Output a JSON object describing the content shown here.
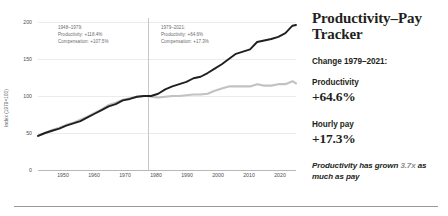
{
  "panel": {
    "title": "Productivity–Pay Tracker",
    "change_label": "Change 1979–2021:",
    "stats": [
      {
        "name": "Productivity",
        "value": "+64.6%"
      },
      {
        "name": "Hourly pay",
        "value": "+17.3%"
      }
    ],
    "footnote_pre": "Productivity has grown ",
    "footnote_accent": "3.7x",
    "footnote_post": " as much as pay"
  },
  "annotations": [
    {
      "period": "1948–1979:",
      "productivity": "Productivity: +118.4%",
      "compensation": "Compensation: +107.5%"
    },
    {
      "period": "1979–2021:",
      "productivity": "Productivity: +64.6%",
      "compensation": "Compensation: +17.3%"
    }
  ],
  "chart_data": {
    "type": "line",
    "title": "",
    "xlabel": "",
    "ylabel": "Index (1979=100)",
    "xlim": [
      1948,
      2021
    ],
    "ylim": [
      0,
      200
    ],
    "yticks": [
      0,
      50,
      100,
      150,
      200
    ],
    "xticks": [
      1950,
      1960,
      1970,
      1980,
      1990,
      2000,
      2010,
      2020
    ],
    "grid": true,
    "legend": "none",
    "marker_year": 1979,
    "colors": {
      "productivity": "#231f20",
      "pay": "#c3c1c1"
    },
    "x": [
      1948,
      1950,
      1952,
      1954,
      1956,
      1958,
      1960,
      1962,
      1964,
      1966,
      1968,
      1970,
      1972,
      1974,
      1976,
      1978,
      1979,
      1980,
      1982,
      1984,
      1986,
      1988,
      1990,
      1992,
      1994,
      1996,
      1998,
      2000,
      2002,
      2004,
      2006,
      2008,
      2010,
      2012,
      2014,
      2016,
      2018,
      2020,
      2021
    ],
    "series": [
      {
        "name": "Productivity",
        "values": [
          46,
          50,
          53,
          56,
          60,
          63,
          66,
          71,
          76,
          81,
          86,
          89,
          94,
          96,
          99,
          100,
          100,
          100,
          103,
          109,
          113,
          116,
          119,
          124,
          126,
          131,
          137,
          143,
          150,
          157,
          160,
          163,
          173,
          175,
          177,
          180,
          185,
          195,
          196
        ]
      },
      {
        "name": "Hourly pay",
        "values": [
          46,
          50,
          54,
          57,
          61,
          64,
          68,
          72,
          77,
          82,
          88,
          91,
          95,
          97,
          99,
          100,
          100,
          99,
          98,
          99,
          100,
          100,
          101,
          102,
          102,
          103,
          107,
          110,
          113,
          113,
          113,
          113,
          116,
          114,
          114,
          116,
          116,
          120,
          117
        ]
      }
    ]
  }
}
